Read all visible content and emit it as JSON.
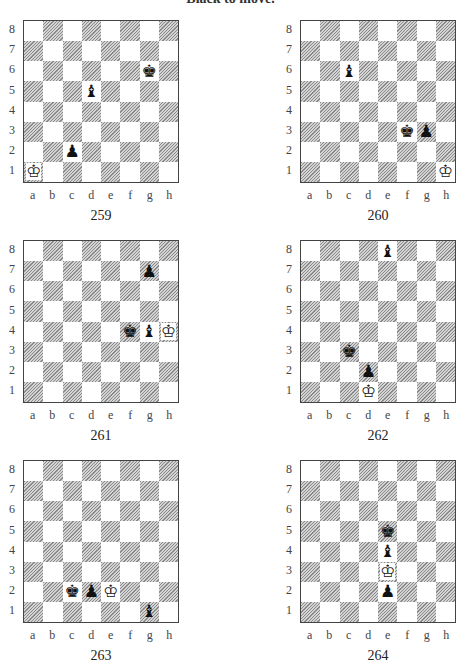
{
  "heading": "Black to move.",
  "files": [
    "a",
    "b",
    "c",
    "d",
    "e",
    "f",
    "g",
    "h"
  ],
  "ranks": [
    "8",
    "7",
    "6",
    "5",
    "4",
    "3",
    "2",
    "1"
  ],
  "diagrams": [
    {
      "number": "259",
      "x": 23,
      "y": 20,
      "pieces": [
        {
          "square": "a1",
          "color": "white",
          "type": "king",
          "glyph": "♔"
        },
        {
          "square": "c2",
          "color": "black",
          "type": "pawn",
          "glyph": "♟"
        },
        {
          "square": "d5",
          "color": "black",
          "type": "bishop",
          "glyph": "♝"
        },
        {
          "square": "g6",
          "color": "black",
          "type": "king",
          "glyph": "♚"
        }
      ]
    },
    {
      "number": "260",
      "x": 300,
      "y": 20,
      "pieces": [
        {
          "square": "c6",
          "color": "black",
          "type": "bishop",
          "glyph": "♝"
        },
        {
          "square": "f3",
          "color": "black",
          "type": "king",
          "glyph": "♚"
        },
        {
          "square": "g3",
          "color": "black",
          "type": "pawn",
          "glyph": "♟"
        },
        {
          "square": "h1",
          "color": "white",
          "type": "king",
          "glyph": "♔"
        }
      ]
    },
    {
      "number": "261",
      "x": 23,
      "y": 240,
      "pieces": [
        {
          "square": "g7",
          "color": "black",
          "type": "pawn",
          "glyph": "♟"
        },
        {
          "square": "f4",
          "color": "black",
          "type": "king",
          "glyph": "♚"
        },
        {
          "square": "g4",
          "color": "black",
          "type": "bishop",
          "glyph": "♝"
        },
        {
          "square": "h4",
          "color": "white",
          "type": "king",
          "glyph": "♔"
        }
      ]
    },
    {
      "number": "262",
      "x": 300,
      "y": 240,
      "pieces": [
        {
          "square": "e8",
          "color": "black",
          "type": "bishop",
          "glyph": "♝"
        },
        {
          "square": "c3",
          "color": "black",
          "type": "king",
          "glyph": "♚"
        },
        {
          "square": "d2",
          "color": "black",
          "type": "pawn",
          "glyph": "♟"
        },
        {
          "square": "d1",
          "color": "white",
          "type": "king",
          "glyph": "♔"
        }
      ]
    },
    {
      "number": "263",
      "x": 23,
      "y": 460,
      "pieces": [
        {
          "square": "c2",
          "color": "black",
          "type": "king",
          "glyph": "♚"
        },
        {
          "square": "d2",
          "color": "black",
          "type": "pawn",
          "glyph": "♟"
        },
        {
          "square": "e2",
          "color": "white",
          "type": "king",
          "glyph": "♔"
        },
        {
          "square": "g1",
          "color": "black",
          "type": "bishop",
          "glyph": "♝"
        }
      ]
    },
    {
      "number": "264",
      "x": 300,
      "y": 460,
      "pieces": [
        {
          "square": "e5",
          "color": "black",
          "type": "king",
          "glyph": "♚"
        },
        {
          "square": "e4",
          "color": "black",
          "type": "bishop",
          "glyph": "♝"
        },
        {
          "square": "e3",
          "color": "white",
          "type": "king",
          "glyph": "♔"
        },
        {
          "square": "e2",
          "color": "black",
          "type": "pawn",
          "glyph": "♟"
        }
      ]
    }
  ]
}
